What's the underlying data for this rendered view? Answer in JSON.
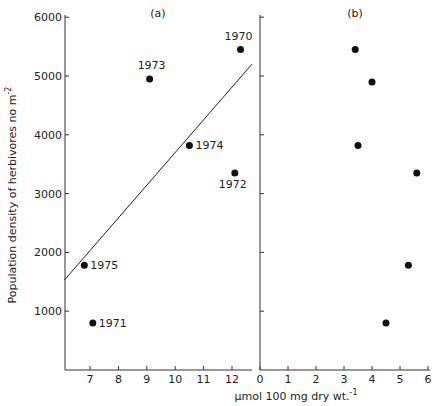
{
  "chart_data": [
    {
      "type": "scatter",
      "panel_label": "(a)",
      "xlabel": "µmol 100 mg dry wt.⁻¹",
      "ylabel": "Population density of herbivores no m⁻²",
      "xlim": [
        6.1,
        12.6
      ],
      "ylim": [
        0,
        6000
      ],
      "xticks": [
        7,
        8,
        9,
        10,
        11,
        12
      ],
      "yticks": [
        1000,
        2000,
        3000,
        4000,
        5000,
        6000
      ],
      "grid": false,
      "points": [
        {
          "label": "1970",
          "x": 12.3,
          "y": 5450
        },
        {
          "label": "1971",
          "x": 7.1,
          "y": 800
        },
        {
          "label": "1972",
          "x": 12.1,
          "y": 3350
        },
        {
          "label": "1973",
          "x": 9.1,
          "y": 4950
        },
        {
          "label": "1974",
          "x": 10.5,
          "y": 3820
        },
        {
          "label": "1975",
          "x": 6.8,
          "y": 1780
        }
      ],
      "regression_line": {
        "x1": 6.1,
        "y1": 1530,
        "x2": 12.7,
        "y2": 5200
      }
    },
    {
      "type": "scatter",
      "panel_label": "(b)",
      "xlabel": "µmol 100 mg dry wt.⁻¹",
      "xlim": [
        0,
        6
      ],
      "ylim": [
        0,
        6000
      ],
      "xticks": [
        0,
        1,
        2,
        3,
        4,
        5,
        6
      ],
      "grid": false,
      "points": [
        {
          "x": 3.4,
          "y": 5450
        },
        {
          "x": 4.0,
          "y": 4900
        },
        {
          "x": 3.5,
          "y": 3820
        },
        {
          "x": 5.6,
          "y": 3350
        },
        {
          "x": 5.3,
          "y": 1780
        },
        {
          "x": 4.5,
          "y": 800
        }
      ]
    }
  ],
  "labels": {
    "panel_a": "(a)",
    "panel_b": "(b)",
    "ylabel": "Population density of herbivores no m",
    "ylabel_sup": "-2",
    "xlabel": "µmol 100 mg dry wt.",
    "xlabel_sup": "-1"
  }
}
